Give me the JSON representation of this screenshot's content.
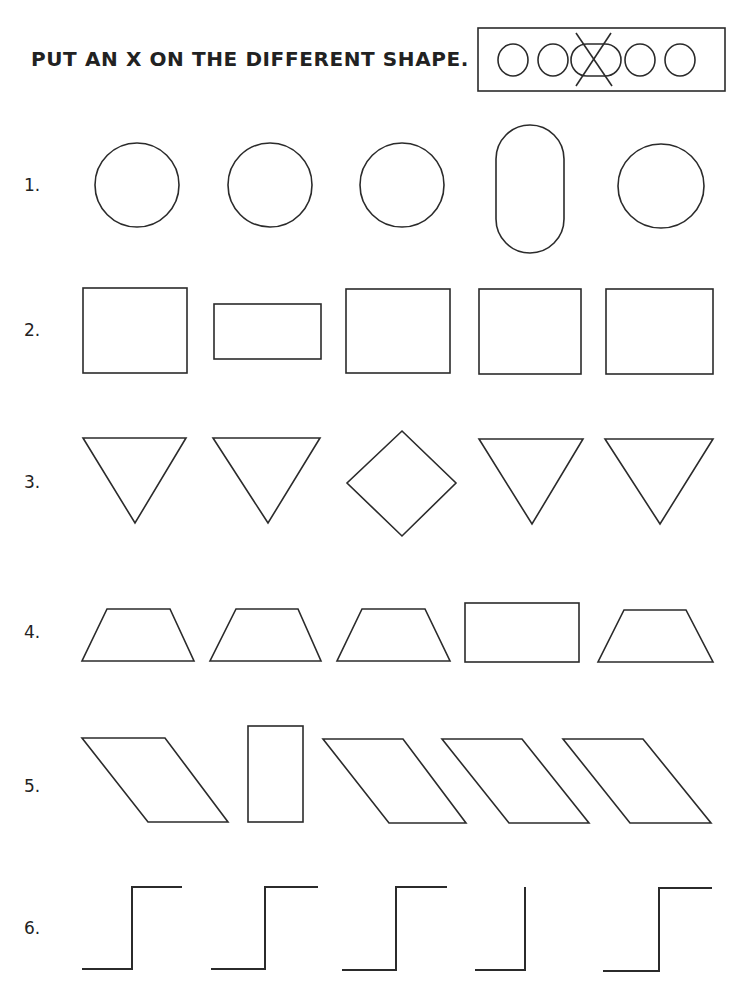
{
  "worksheet": {
    "instruction": "PUT AN X ON THE DIFFERENT SHAPE.",
    "example": {
      "shapes": [
        "circle",
        "circle",
        "pill-horizontal",
        "circle",
        "circle"
      ],
      "marked_index": 2,
      "mark": "X"
    },
    "rows": [
      {
        "label": "1.",
        "shapes": [
          "circle",
          "circle",
          "circle",
          "pill-vertical",
          "circle"
        ],
        "different_index": 3
      },
      {
        "label": "2.",
        "shapes": [
          "square",
          "rectangle",
          "square",
          "square",
          "square"
        ],
        "different_index": 1
      },
      {
        "label": "3.",
        "shapes": [
          "triangle-down",
          "triangle-down",
          "diamond",
          "triangle-down",
          "triangle-down"
        ],
        "different_index": 2
      },
      {
        "label": "4.",
        "shapes": [
          "trapezoid",
          "trapezoid",
          "trapezoid",
          "rectangle",
          "trapezoid"
        ],
        "different_index": 3
      },
      {
        "label": "5.",
        "shapes": [
          "parallelogram",
          "rectangle-tall",
          "parallelogram",
          "parallelogram",
          "parallelogram"
        ],
        "different_index": 1
      },
      {
        "label": "6.",
        "shapes": [
          "step",
          "step",
          "step",
          "corner-no-top-arm",
          "step"
        ],
        "different_index": 3
      }
    ]
  }
}
